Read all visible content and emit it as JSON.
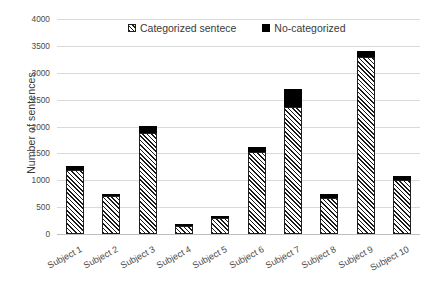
{
  "chart_data": {
    "type": "bar",
    "subtype": "stacked-vertical",
    "title": "",
    "xlabel": "",
    "ylabel": "Number of sentences",
    "ylim": [
      0,
      4000
    ],
    "ytick_step": 500,
    "yticks": [
      "4000",
      "3500",
      "3000",
      "2500",
      "2000",
      "1500",
      "1000",
      "500",
      "0"
    ],
    "ytick_values": [
      4000,
      3500,
      3000,
      2500,
      2000,
      1500,
      1000,
      500,
      0
    ],
    "grid": "horizontal",
    "legend_position": "top-center",
    "categories": [
      "Subject 1",
      "Subject 2",
      "Subject 3",
      "Subject 4",
      "Subject 5",
      "Subject 6",
      "Subject 7",
      "Subject 8",
      "Subject 9",
      "Subject 10"
    ],
    "series": [
      {
        "name": "Categorized sentece",
        "fill": "diagonal-hatch",
        "color": "#1a1a1a",
        "values": [
          1190,
          700,
          1880,
          150,
          295,
          1525,
          2360,
          670,
          3300,
          1010
        ]
      },
      {
        "name": "No-categorized",
        "fill": "solid",
        "color": "#000000",
        "values": [
          80,
          25,
          130,
          5,
          10,
          85,
          330,
          70,
          100,
          70
        ]
      }
    ],
    "totals": [
      1270,
      725,
      2010,
      155,
      305,
      1610,
      2690,
      740,
      3400,
      1080
    ]
  },
  "legend": {
    "items": [
      {
        "label": "Categorized sentece",
        "swatch": "hatch-swatch-icon"
      },
      {
        "label": "No-categorized",
        "swatch": "solid-swatch-icon"
      }
    ]
  },
  "axes": {
    "y_title": "Number of sentences"
  },
  "colors": {
    "gridline": "#d9d9d9",
    "baseline": "#bfbfbf",
    "hatch": "#1a1a1a",
    "solid": "#000000",
    "text": "#3a3a3a",
    "background": "#ffffff"
  }
}
